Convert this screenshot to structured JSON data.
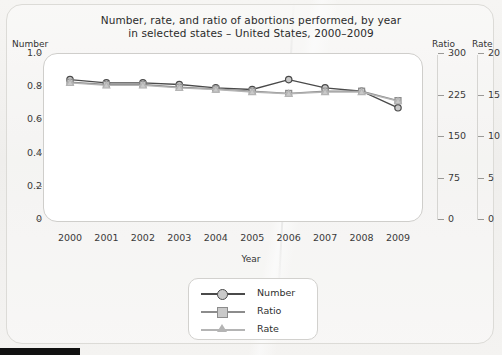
{
  "chart_data": {
    "type": "line",
    "title": "Number, rate, and ratio of abortions performed, by year in selected states – United States, 2000–2009",
    "title_line1": "Number, rate, and ratio of abortions performed, by year",
    "title_line2": "in selected states – United States, 2000–2009",
    "xlabel": "Year",
    "categories": [
      "2000",
      "2001",
      "2002",
      "2003",
      "2004",
      "2005",
      "2006",
      "2007",
      "2008",
      "2009"
    ],
    "axes": {
      "left": {
        "label": "Number",
        "ticks": [
          "1.0",
          "0.8",
          "0.6",
          "0.4",
          "0.2",
          "0"
        ],
        "tick_values": [
          1.0,
          0.8,
          0.6,
          0.4,
          0.2,
          0
        ],
        "range": [
          0,
          1.0
        ]
      },
      "right_primary": {
        "label": "Ratio",
        "ticks": [
          "300",
          "225",
          "150",
          "75",
          "0"
        ],
        "tick_values": [
          300,
          225,
          150,
          75,
          0
        ],
        "range": [
          0,
          300
        ]
      },
      "right_secondary": {
        "label": "Rate",
        "ticks": [
          "20",
          "15",
          "10",
          "5",
          "0"
        ],
        "tick_values": [
          20,
          15,
          10,
          5,
          0
        ],
        "range": [
          0,
          20
        ]
      }
    },
    "grid": false,
    "legend_position": "below-plot",
    "series": [
      {
        "name": "Number",
        "axis": "left",
        "marker": "circle",
        "color": "#4a4a4a",
        "values": [
          0.84,
          0.82,
          0.82,
          0.81,
          0.79,
          0.78,
          0.84,
          0.79,
          0.77,
          0.67
        ]
      },
      {
        "name": "Ratio",
        "axis": "right_primary",
        "marker": "square",
        "color": "#8c8c8c",
        "values": [
          247,
          243,
          243,
          238,
          235,
          231,
          227,
          231,
          231,
          214
        ]
      },
      {
        "name": "Rate",
        "axis": "right_secondary",
        "marker": "triangle",
        "color": "#b4b4b4",
        "values": [
          16.4,
          16.1,
          16.1,
          15.8,
          15.6,
          15.3,
          15.1,
          15.3,
          15.3,
          14.2
        ]
      }
    ]
  },
  "legend": {
    "items": [
      {
        "label": "Number",
        "marker": "circle",
        "color": "#4a4a4a"
      },
      {
        "label": "Ratio",
        "marker": "square",
        "color": "#8c8c8c"
      },
      {
        "label": "Rate",
        "marker": "triangle",
        "color": "#b4b4b4"
      }
    ]
  },
  "colors": {
    "number": "#4a4a4a",
    "ratio": "#8c8c8c",
    "rate": "#b4b4b4",
    "paper": "#f2f1ef",
    "plot_bg": "#ffffff",
    "axis": "#9b9a97"
  }
}
